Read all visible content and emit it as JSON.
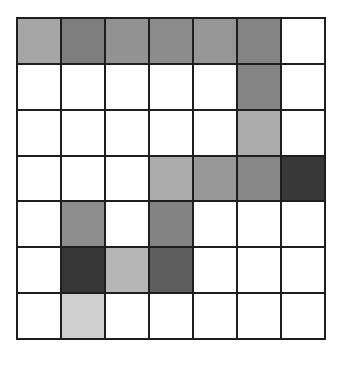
{
  "grid": {
    "rows": 7,
    "cols": 7,
    "cells": [
      [
        "#a6a6a6",
        "#7e7e7e",
        "#929292",
        "#8c8c8c",
        "#969696",
        "#848484",
        "#ffffff"
      ],
      [
        "#ffffff",
        "#ffffff",
        "#ffffff",
        "#ffffff",
        "#ffffff",
        "#848484",
        "#ffffff"
      ],
      [
        "#ffffff",
        "#ffffff",
        "#ffffff",
        "#ffffff",
        "#ffffff",
        "#acacac",
        "#ffffff"
      ],
      [
        "#ffffff",
        "#ffffff",
        "#ffffff",
        "#acacac",
        "#989898",
        "#888888",
        "#383838"
      ],
      [
        "#ffffff",
        "#8e8e8e",
        "#ffffff",
        "#838383",
        "#ffffff",
        "#ffffff",
        "#ffffff"
      ],
      [
        "#ffffff",
        "#363636",
        "#b6b6b6",
        "#5e5e5e",
        "#ffffff",
        "#ffffff",
        "#ffffff"
      ],
      [
        "#ffffff",
        "#cfcfcf",
        "#ffffff",
        "#ffffff",
        "#ffffff",
        "#ffffff",
        "#ffffff"
      ]
    ]
  }
}
